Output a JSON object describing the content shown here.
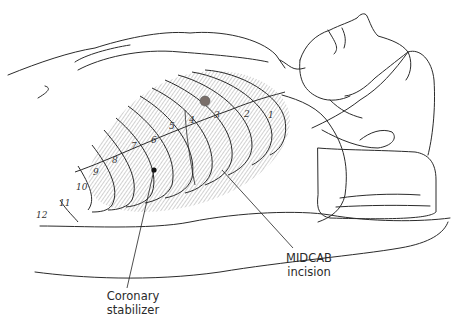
{
  "figure": {
    "colors": {
      "line": "#2b2b2b",
      "hatch": "#9a9a9a",
      "incision": "#7a6f6a",
      "background": "#ffffff"
    }
  },
  "labels": {
    "midcab": {
      "line1": "MIDCAB",
      "line2": "incision"
    },
    "stabilizer": {
      "line1": "Coronary",
      "line2": "stabilizer"
    }
  },
  "rib_numbers": [
    {
      "n": "1",
      "x": 268,
      "y": 118
    },
    {
      "n": "2",
      "x": 244,
      "y": 117
    },
    {
      "n": "3",
      "x": 214,
      "y": 118
    },
    {
      "n": "4",
      "x": 189,
      "y": 123
    },
    {
      "n": "5",
      "x": 169,
      "y": 129
    },
    {
      "n": "6",
      "x": 151,
      "y": 143
    },
    {
      "n": "7",
      "x": 131,
      "y": 149
    },
    {
      "n": "8",
      "x": 112,
      "y": 163
    },
    {
      "n": "9",
      "x": 93,
      "y": 175
    },
    {
      "n": "10",
      "x": 76,
      "y": 190
    },
    {
      "n": "11",
      "x": 59,
      "y": 206
    },
    {
      "n": "12",
      "x": 36,
      "y": 218
    }
  ]
}
